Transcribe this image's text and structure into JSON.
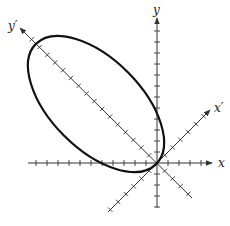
{
  "figure": {
    "type": "rotated-axes-ellipse",
    "labels": {
      "x": "x",
      "y": "y",
      "x_prime": "x′",
      "y_prime": "y′"
    },
    "origin_px": [
      157,
      163
    ],
    "rotation_deg": 45,
    "axes": {
      "x": {
        "from": [
          28,
          163
        ],
        "to": [
          212,
          163
        ],
        "arrow": "positive",
        "tick_spacing_px": 11
      },
      "y": {
        "from": [
          157,
          208
        ],
        "to": [
          157,
          18
        ],
        "arrow": "positive",
        "tick_spacing_px": 11
      },
      "x_prime": {
        "from": [
          108,
          212
        ],
        "to": [
          210,
          110
        ],
        "arrow": "positive",
        "tick_spacing_px": 11
      },
      "y_prime": {
        "from": [
          192,
          198
        ],
        "to": [
          20,
          28
        ],
        "arrow": "positive",
        "tick_spacing_px": 11
      }
    },
    "ellipse": {
      "center_px": [
        96,
        104
      ],
      "semi_major_px": 85,
      "semi_minor_px": 45,
      "major_axis_direction": "y_prime",
      "passes_through_origin": true,
      "stroke": "#111111",
      "stroke_width": 2.2
    },
    "colors": {
      "axis": "#333333",
      "curve": "#111111",
      "background": "#ffffff"
    }
  }
}
